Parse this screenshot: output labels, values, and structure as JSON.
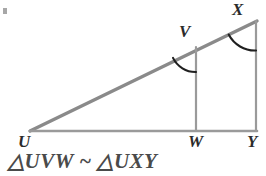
{
  "figure": {
    "type": "similar-triangles-diagram",
    "background_color": "#ffffff",
    "stroke_color_hypotenuse": "#8a8a8a",
    "stroke_color_lines": "#9a9a9a",
    "arc_color": "#1f1f1f",
    "label_color": "#2b2b2b",
    "caption_color": "#4a4a4a",
    "vertices": {
      "U": {
        "label": "U",
        "x": 30,
        "y": 131
      },
      "V": {
        "label": "V",
        "x": 196,
        "y": 47
      },
      "W": {
        "label": "W",
        "x": 196,
        "y": 131
      },
      "X": {
        "label": "X",
        "x": 256,
        "y": 21
      },
      "Y": {
        "label": "Y",
        "x": 256,
        "y": 131
      }
    },
    "segments": [
      {
        "name": "UX-hypotenuse",
        "from": "U",
        "to": "X"
      },
      {
        "name": "UY-base",
        "from": "U",
        "to": "Y"
      },
      {
        "name": "VW-leg",
        "from": "V",
        "to": "W"
      },
      {
        "name": "XY-leg",
        "from": "X",
        "to": "Y"
      }
    ],
    "angle_marks": [
      {
        "name": "angle-at-V",
        "vertex": "V"
      },
      {
        "name": "angle-at-X",
        "vertex": "X"
      }
    ]
  },
  "caption": {
    "text": "△UVW ~ △UXY"
  }
}
